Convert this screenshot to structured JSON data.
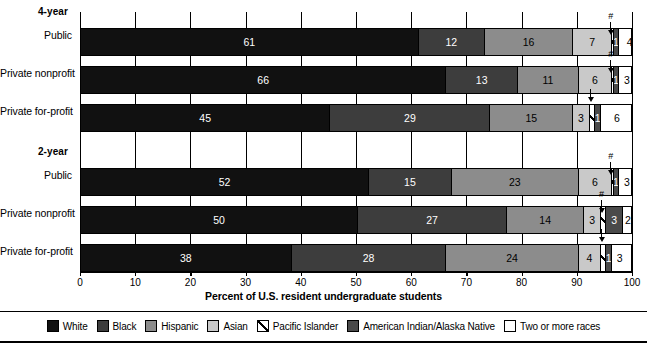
{
  "chart_data": {
    "type": "bar",
    "orientation": "horizontal",
    "stacked": true,
    "normalized_percent": true,
    "title": "",
    "xlabel": "Percent of U.S. resident undergraduate students",
    "ylabel": "",
    "xlim": [
      0,
      100
    ],
    "xticks": [
      0,
      10,
      20,
      30,
      40,
      50,
      60,
      70,
      80,
      90,
      100
    ],
    "xtick_labels": [
      "0",
      "10",
      "20",
      "30",
      "40",
      "50",
      "60",
      "70",
      "80",
      "90",
      "100"
    ],
    "grid": true,
    "legend_position": "bottom",
    "categories": [
      "White",
      "Black",
      "Hispanic",
      "Asian",
      "Pacific Islander",
      "American Indian/Alaska Native",
      "Two or more races"
    ],
    "category_colors": [
      "#111111",
      "#3d3d3d",
      "#8c8c8c",
      "#c9c9c9",
      "#ffffff",
      "#4a4a4a",
      "#ffffff"
    ],
    "annotation_symbol": "#",
    "groups": [
      {
        "name": "4-year",
        "rows": [
          {
            "label": "Public",
            "values": [
              61,
              12,
              16,
              7,
              0.3,
              1,
              4
            ],
            "labels": [
              "61",
              "12",
              "16",
              "7",
              "",
              "1",
              "4"
            ],
            "annotated_category": "Pacific Islander",
            "annotation": "#"
          },
          {
            "label": "Private nonprofit",
            "values": [
              66,
              13,
              11,
              6,
              0.3,
              1,
              3
            ],
            "labels": [
              "66",
              "13",
              "11",
              "6",
              "",
              "1",
              "3"
            ],
            "annotated_category": "Pacific Islander",
            "annotation": "#"
          },
          {
            "label": "Private for-profit",
            "values": [
              45,
              29,
              15,
              3,
              1,
              1,
              6
            ],
            "labels": [
              "45",
              "29",
              "15",
              "3",
              "",
              "1",
              "6"
            ],
            "annotated_category": "Pacific Islander",
            "annotation": ""
          }
        ]
      },
      {
        "name": "2-year",
        "rows": [
          {
            "label": "Public",
            "values": [
              52,
              15,
              23,
              6,
              0.3,
              1,
              3
            ],
            "labels": [
              "52",
              "15",
              "23",
              "6",
              "",
              "1",
              "3"
            ],
            "annotated_category": "Pacific Islander",
            "annotation": "#"
          },
          {
            "label": "Private nonprofit",
            "values": [
              50,
              27,
              14,
              3,
              1,
              3,
              2
            ],
            "labels": [
              "50",
              "27",
              "14",
              "3",
              "",
              "3",
              "2"
            ],
            "annotated_category": "Pacific Islander",
            "annotation": "#"
          },
          {
            "label": "Private for-profit",
            "values": [
              38,
              28,
              24,
              4,
              1,
              1,
              3
            ],
            "labels": [
              "38",
              "28",
              "24",
              "4",
              "",
              "1",
              "3"
            ],
            "annotated_category": "Pacific Islander",
            "annotation": ""
          }
        ]
      }
    ]
  }
}
